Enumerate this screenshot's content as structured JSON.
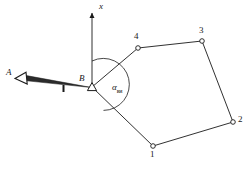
{
  "figure": {
    "type": "surveying-traverse-diagram",
    "background_color": "#ffffff",
    "line_color": "#1a1a1a",
    "labels": {
      "axis_x": "x",
      "station_a": "A",
      "station_b": "B",
      "angle": "α",
      "angle_subscript": "ви",
      "vertex_1": "1",
      "vertex_2": "2",
      "vertex_3": "3",
      "vertex_4": "4"
    },
    "geometry": {
      "origin_b": [
        92,
        87
      ],
      "axis_x_tip": [
        92,
        10
      ],
      "axis_x_base": [
        92,
        87
      ],
      "arrow_a_tip": [
        20,
        77
      ],
      "arrow_a_tail": [
        92,
        87
      ],
      "arc_center": [
        92,
        87
      ],
      "arc_radius": 26,
      "arc_start_deg": 90,
      "arc_end_deg": -64,
      "vertices": [
        {
          "id": "1",
          "x": 153,
          "y": 146
        },
        {
          "id": "2",
          "x": 233,
          "y": 122
        },
        {
          "id": "3",
          "x": 202,
          "y": 41
        },
        {
          "id": "4",
          "x": 138,
          "y": 48
        }
      ],
      "edges": [
        [
          "B",
          "4"
        ],
        [
          "4",
          "3"
        ],
        [
          "3",
          "2"
        ],
        [
          "2",
          "1"
        ],
        [
          "1",
          "B"
        ]
      ]
    },
    "label_positions": {
      "axis_x": [
        99,
        3
      ],
      "station_a": [
        7,
        69
      ],
      "station_b": [
        80,
        76
      ],
      "angle": [
        113,
        84
      ],
      "vertex_1": [
        150,
        151
      ],
      "vertex_2": [
        237,
        116
      ],
      "vertex_3": [
        199,
        27
      ],
      "vertex_4": [
        134,
        33
      ]
    }
  }
}
